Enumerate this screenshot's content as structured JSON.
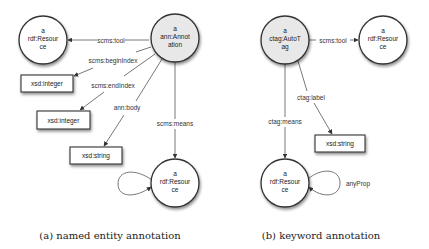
{
  "diagram_a": {
    "caption": "(a) named entity annotation",
    "nodes": {
      "annotation": {
        "line1": "a",
        "line2": "ann:Annot",
        "line3": "ation"
      },
      "tool_resource": {
        "line1": "a",
        "line2": "rdf:Resour",
        "line3": "ce"
      },
      "means_resource": {
        "line1": "a",
        "line2": "rdf:Resour",
        "line3": "ce"
      },
      "begin_integer": {
        "label": "xsd:integer"
      },
      "end_integer": {
        "label": "xsd:integer"
      },
      "body_string": {
        "label": "xsd:string"
      }
    },
    "edges": {
      "tool": "scms:tool",
      "begin_index": "scms:beginIndex",
      "end_index": "scms:endIndex",
      "body": "ann:body",
      "means": "scms:means"
    }
  },
  "diagram_b": {
    "caption": "(b) keyword annotation",
    "nodes": {
      "autotag": {
        "line1": "a",
        "line2": "ctag:AutoT",
        "line3": "ag"
      },
      "tool_resource": {
        "line1": "a",
        "line2": "rdf:Resour",
        "line3": "ce"
      },
      "means_resource": {
        "line1": "a",
        "line2": "rdf:Resour",
        "line3": "ce"
      },
      "label_string": {
        "label": "xsd:string"
      }
    },
    "edges": {
      "tool": "scms:tool",
      "label": "ctag:label",
      "means": "ctag:means",
      "any_prop": "anyProp"
    }
  },
  "colors": {
    "resource_fill": "#ffffff",
    "subject_fill": "#e8e8e8",
    "stroke": "#333333"
  }
}
